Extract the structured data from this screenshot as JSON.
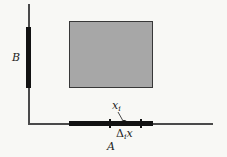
{
  "figure": {
    "type": "calculus-partition-diagram",
    "region_label_y": "B",
    "region_label_x": "A",
    "sample_point_label": {
      "main": "x",
      "sub": "i"
    },
    "delta_label": {
      "main": "Δ",
      "sub": "i",
      "var": "x"
    }
  },
  "colors": {
    "bg": "#f8f8f5",
    "rect-fill": "#a7a7a7",
    "rect-border": "#383838",
    "axis": "#4a4a4a",
    "segment": "#121212",
    "text": "#1c1c1c"
  }
}
